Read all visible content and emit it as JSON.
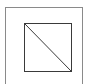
{
  "diagram": {
    "outer_frame": {
      "x": 5,
      "y": 7,
      "width": 78,
      "height": 80,
      "stroke": "#8a8a8a"
    },
    "inner_square": {
      "x": 24.5,
      "y": 23.5,
      "width": 47,
      "height": 48,
      "stroke": "#3a3a3a"
    },
    "diagonal": {
      "x1": 24.5,
      "y1": 23.5,
      "x2": 71.5,
      "y2": 71.5,
      "stroke": "#3a3a3a"
    }
  }
}
